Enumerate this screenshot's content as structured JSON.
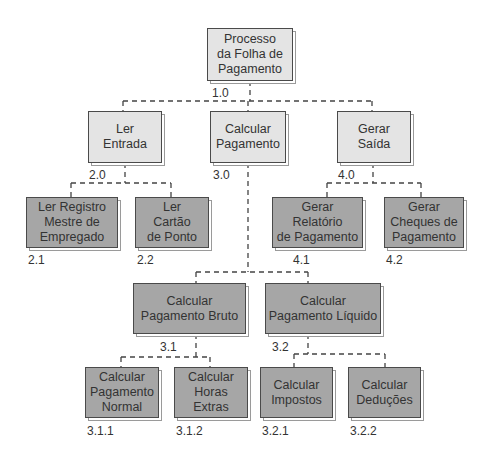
{
  "diagram": {
    "type": "hierarchy-chart",
    "colors": {
      "level_light": "#e4e4e4",
      "level_dark": "#a6a6a6",
      "border": "#4a4a4a"
    },
    "nodes": [
      {
        "id": "1.0",
        "label": "Processo\nda Folha de\nPagamento",
        "number": "1.0"
      },
      {
        "id": "2.0",
        "label": "Ler\nEntrada",
        "number": "2.0"
      },
      {
        "id": "3.0",
        "label": "Calcular\nPagamento",
        "number": "3.0"
      },
      {
        "id": "4.0",
        "label": "Gerar\nSaída",
        "number": "4.0"
      },
      {
        "id": "2.1",
        "label": "Ler Registro\nMestre de\nEmpregado",
        "number": "2.1"
      },
      {
        "id": "2.2",
        "label": "Ler\nCartão\nde Ponto",
        "number": "2.2"
      },
      {
        "id": "4.1",
        "label": "Gerar\nRelatório\nde Pagamento",
        "number": "4.1"
      },
      {
        "id": "4.2",
        "label": "Gerar\nCheques de\nPagamento",
        "number": "4.2"
      },
      {
        "id": "3.1",
        "label": "Calcular\nPagamento Bruto",
        "number": "3.1"
      },
      {
        "id": "3.2",
        "label": "Calcular\nPagamento Líquido",
        "number": "3.2"
      },
      {
        "id": "3.1.1",
        "label": "Calcular\nPagamento\nNormal",
        "number": "3.1.1"
      },
      {
        "id": "3.1.2",
        "label": "Calcular\nHoras\nExtras",
        "number": "3.1.2"
      },
      {
        "id": "3.2.1",
        "label": "Calcular\nImpostos",
        "number": "3.2.1"
      },
      {
        "id": "3.2.2",
        "label": "Calcular\nDeduções",
        "number": "3.2.2"
      }
    ]
  }
}
